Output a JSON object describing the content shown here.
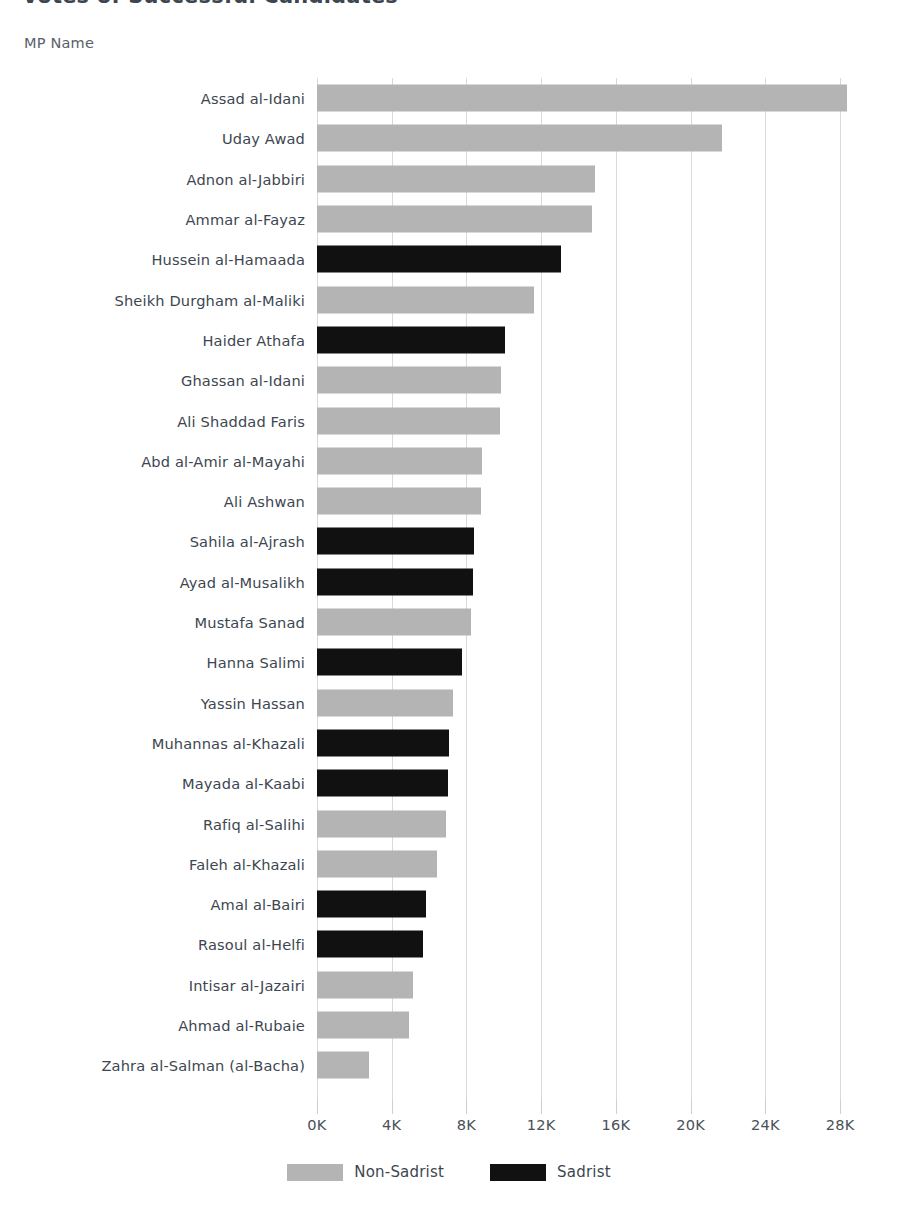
{
  "chart_data": {
    "type": "bar",
    "orientation": "horizontal",
    "title": "Votes of Successful Candidates",
    "xlabel": "",
    "ylabel": "MP Name",
    "xlim": [
      0,
      28800
    ],
    "xticks": [
      0,
      4000,
      8000,
      12000,
      16000,
      20000,
      24000,
      28000
    ],
    "xtick_labels": [
      "0K",
      "4K",
      "8K",
      "12K",
      "16K",
      "20K",
      "24K",
      "28K"
    ],
    "grid": "vertical",
    "legend_position": "bottom",
    "categories": [
      "Assad al-Idani",
      "Uday Awad",
      "Adnon al-Jabbiri",
      "Ammar al-Fayaz",
      "Hussein al-Hamaada",
      "Sheikh Durgham al-Maliki",
      "Haider Athafa",
      "Ghassan al-Idani",
      "Ali Shaddad Faris",
      "Abd al-Amir al-Mayahi",
      "Ali Ashwan",
      "Sahila al-Ajrash",
      "Ayad al-Musalikh",
      "Mustafa Sanad",
      "Hanna Salimi",
      "Yassin Hassan",
      "Muhannas al-Khazali",
      "Mayada al-Kaabi",
      "Rafiq al-Salihi",
      "Faleh al-Khazali",
      "Amal al-Bairi",
      "Rasoul al-Helfi",
      "Intisar al-Jazairi",
      "Ahmad al-Rubaie",
      "Zahra al-Salman (al-Bacha)"
    ],
    "values": [
      28350,
      21660,
      14860,
      14700,
      13070,
      11600,
      10070,
      9850,
      9800,
      8850,
      8800,
      8430,
      8330,
      8270,
      7750,
      7270,
      7050,
      7010,
      6900,
      6430,
      5850,
      5700,
      5160,
      4900,
      2790
    ],
    "groups": [
      "Non-Sadrist",
      "Non-Sadrist",
      "Non-Sadrist",
      "Non-Sadrist",
      "Sadrist",
      "Non-Sadrist",
      "Sadrist",
      "Non-Sadrist",
      "Non-Sadrist",
      "Non-Sadrist",
      "Non-Sadrist",
      "Sadrist",
      "Sadrist",
      "Non-Sadrist",
      "Sadrist",
      "Non-Sadrist",
      "Sadrist",
      "Sadrist",
      "Non-Sadrist",
      "Non-Sadrist",
      "Sadrist",
      "Sadrist",
      "Non-Sadrist",
      "Non-Sadrist",
      "Non-Sadrist"
    ],
    "legend": [
      {
        "label": "Non-Sadrist",
        "color": "#b4b4b4"
      },
      {
        "label": "Sadrist",
        "color": "#111111"
      }
    ],
    "colors": {
      "non_sadrist": "#b4b4b4",
      "sadrist": "#111111",
      "grid": "#d9d9d9",
      "text": "#3d4650"
    }
  }
}
